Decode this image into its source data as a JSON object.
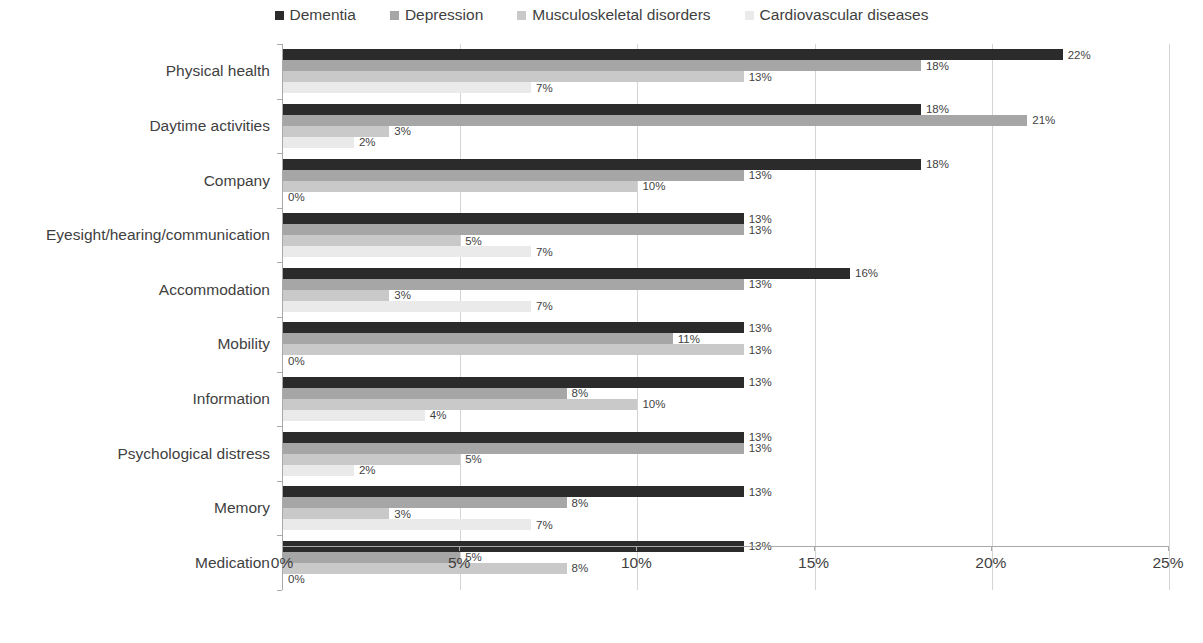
{
  "legend": {
    "position": "top-center",
    "items": [
      {
        "label": "Dementia",
        "color": "#2b2b2b"
      },
      {
        "label": "Depression",
        "color": "#a6a6a6"
      },
      {
        "label": "Musculoskeletal disorders",
        "color": "#c9c9c9"
      },
      {
        "label": "Cardiovascular diseases",
        "color": "#eaeaea"
      }
    ]
  },
  "axis": {
    "x_ticks": [
      "0%",
      "5%",
      "10%",
      "15%",
      "20%",
      "25%"
    ],
    "x_tick_values": [
      0,
      5,
      10,
      15,
      20,
      25
    ]
  },
  "chart_data": {
    "type": "bar",
    "orientation": "horizontal",
    "title": "",
    "subtitle": "",
    "xlabel": "",
    "ylabel": "",
    "xlim": [
      0,
      25
    ],
    "grid": true,
    "legend_position": "top-center",
    "value_suffix": "%",
    "categories": [
      "Physical health",
      "Daytime activities",
      "Company",
      "Eyesight/hearing/communication",
      "Accommodation",
      "Mobility",
      "Information",
      "Psychological distress",
      "Memory",
      "Medication"
    ],
    "series": [
      {
        "name": "Dementia",
        "color": "#2b2b2b",
        "values": [
          22,
          18,
          18,
          13,
          16,
          13,
          13,
          13,
          13,
          13
        ],
        "labels": [
          "22%",
          "18%",
          "18%",
          "13%",
          "16%",
          "13%",
          "13%",
          "13%",
          "13%",
          "13%"
        ]
      },
      {
        "name": "Depression",
        "color": "#a6a6a6",
        "values": [
          18,
          21,
          13,
          13,
          13,
          11,
          8,
          13,
          8,
          5
        ],
        "labels": [
          "18%",
          "21%",
          "13%",
          "13%",
          "13%",
          "11%",
          "8%",
          "13%",
          "8%",
          "5%"
        ]
      },
      {
        "name": "Musculoskeletal disorders",
        "color": "#c9c9c9",
        "values": [
          13,
          3,
          10,
          5,
          3,
          13,
          10,
          5,
          3,
          8
        ],
        "labels": [
          "13%",
          "3%",
          "10%",
          "5%",
          "3%",
          "13%",
          "10%",
          "5%",
          "3%",
          "8%"
        ]
      },
      {
        "name": "Cardiovascular diseases",
        "color": "#eaeaea",
        "values": [
          7,
          2,
          0,
          7,
          7,
          0,
          4,
          2,
          7,
          0
        ],
        "labels": [
          "7%",
          "2%",
          "0%",
          "7%",
          "7%",
          "0%",
          "4%",
          "2%",
          "7%",
          "0%"
        ]
      }
    ]
  }
}
